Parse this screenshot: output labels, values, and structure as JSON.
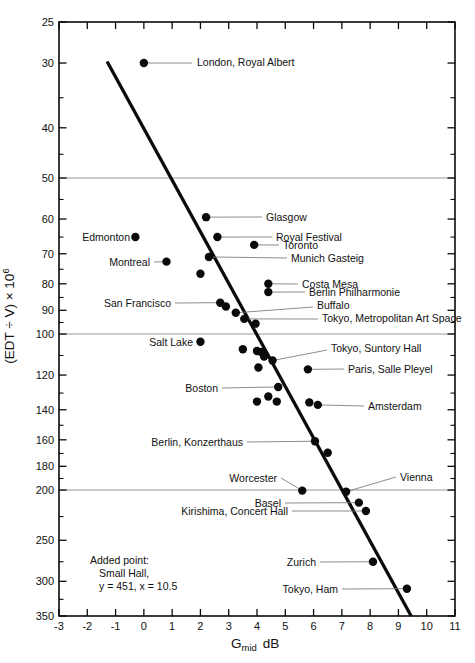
{
  "chart_data": {
    "type": "scatter",
    "title": "",
    "xlabel": {
      "symbol": "G",
      "sub": "mid",
      "unit": "dB"
    },
    "ylabel": {
      "text": "(EDT ÷ V) × 10",
      "sup": "6"
    },
    "xlim": [
      -3,
      11
    ],
    "ylim": [
      25,
      350
    ],
    "yscale": "log",
    "grid": "horizontal-at-50-100-200",
    "x_ticks": [
      -3,
      -2,
      -1,
      0,
      1,
      2,
      3,
      4,
      5,
      6,
      7,
      8,
      9,
      10,
      11
    ],
    "y_ticks_major": [
      25,
      30,
      40,
      50,
      60,
      70,
      80,
      90,
      100,
      120,
      140,
      160,
      180,
      200,
      250,
      300,
      350
    ],
    "y_ticks_minor": [
      35,
      45,
      55,
      65,
      75,
      85,
      95,
      110,
      130,
      150,
      170,
      190,
      225,
      275,
      325
    ],
    "gridlines_y": [
      50,
      100,
      200
    ],
    "regression_line": {
      "x1": -1.3,
      "y1": 29.8,
      "x2": 9.45,
      "y2": 350
    },
    "points": [
      {
        "label": "London, Royal Albert",
        "x": 0.0,
        "y": 30,
        "anchor": "start",
        "label_px": [
          197,
          66
        ],
        "leader": [
          [
            192,
            63
          ]
        ]
      },
      {
        "label": "Glasgow",
        "x": 2.2,
        "y": 59.5,
        "anchor": "start",
        "label_px": [
          266,
          221
        ],
        "leader": [
          [
            262,
            217
          ]
        ]
      },
      {
        "label": "Royal Festival",
        "x": 2.6,
        "y": 65,
        "anchor": "start",
        "label_px": [
          276,
          241
        ],
        "leader": [
          [
            272,
            237
          ]
        ]
      },
      {
        "label": "Toronto",
        "x": 3.9,
        "y": 67.3,
        "anchor": "start",
        "label_px": [
          283,
          249
        ],
        "leader": [
          [
            279,
            245
          ]
        ]
      },
      {
        "label": "Edmonton",
        "x": -0.3,
        "y": 65,
        "anchor": "end",
        "label_px": [
          130,
          241
        ]
      },
      {
        "label": "Montreal",
        "x": 0.8,
        "y": 72.5,
        "anchor": "end",
        "label_px": [
          150,
          266
        ],
        "leader": [
          [
            154,
            262
          ]
        ]
      },
      {
        "label": "Munich Gasteig",
        "x": 2.3,
        "y": 71,
        "anchor": "start",
        "label_px": [
          291,
          262
        ],
        "leader": [
          [
            287,
            258
          ]
        ]
      },
      {
        "label": "",
        "x": 2.0,
        "y": 76.5
      },
      {
        "label": "Costa Mesa",
        "x": 4.4,
        "y": 80,
        "anchor": "start",
        "label_px": [
          302,
          288
        ],
        "leader": [
          [
            298,
            284
          ]
        ]
      },
      {
        "label": "Berlin Philharmonie",
        "x": 4.4,
        "y": 83,
        "anchor": "start",
        "label_px": [
          309,
          296
        ],
        "leader": [
          [
            305,
            292
          ]
        ]
      },
      {
        "label": "San Francisco",
        "x": 2.7,
        "y": 87,
        "anchor": "end",
        "label_px": [
          171,
          307
        ],
        "leader": [
          [
            175,
            303
          ]
        ]
      },
      {
        "label": "",
        "x": 2.9,
        "y": 88.5
      },
      {
        "label": "Buffalo",
        "x": 3.25,
        "y": 91,
        "anchor": "start",
        "label_px": [
          317,
          309
        ],
        "leader": [
          [
            313,
            307
          ]
        ]
      },
      {
        "label": "Tokyo, Metropolitan Art Space",
        "x": 3.55,
        "y": 93.5,
        "anchor": "start",
        "label_px": [
          322,
          322
        ],
        "leader": [
          [
            318,
            319
          ]
        ]
      },
      {
        "label": "",
        "x": 3.95,
        "y": 95.5
      },
      {
        "label": "Salt Lake",
        "x": 2.0,
        "y": 103.5,
        "anchor": "end",
        "label_px": [
          193,
          346
        ]
      },
      {
        "label": "",
        "x": 3.5,
        "y": 107
      },
      {
        "label": "",
        "x": 4.0,
        "y": 107.8
      },
      {
        "label": "",
        "x": 4.15,
        "y": 108.3
      },
      {
        "label": "",
        "x": 4.25,
        "y": 110.5
      },
      {
        "label": "Tokyo, Suntory Hall",
        "x": 4.55,
        "y": 112.5,
        "anchor": "start",
        "label_px": [
          331,
          352
        ],
        "leader": [
          [
            327,
            350
          ]
        ]
      },
      {
        "label": "",
        "x": 4.05,
        "y": 116
      },
      {
        "label": "Paris, Salle Pleyel",
        "x": 5.8,
        "y": 117,
        "anchor": "start",
        "label_px": [
          348,
          373
        ],
        "leader": [
          [
            344,
            369
          ]
        ]
      },
      {
        "label": "Boston",
        "x": 4.75,
        "y": 126.5,
        "anchor": "end",
        "label_px": [
          218,
          392
        ],
        "leader": [
          [
            222,
            388
          ]
        ]
      },
      {
        "label": "",
        "x": 4.4,
        "y": 132
      },
      {
        "label": "",
        "x": 4.0,
        "y": 135
      },
      {
        "label": "",
        "x": 4.7,
        "y": 135
      },
      {
        "label": "",
        "x": 5.85,
        "y": 135.5
      },
      {
        "label": "Amsterdam",
        "x": 6.15,
        "y": 137,
        "anchor": "start",
        "label_px": [
          368,
          410
        ],
        "leader": [
          [
            364,
            406
          ]
        ]
      },
      {
        "label": "Berlin, Konzerthaus",
        "x": 6.05,
        "y": 161,
        "anchor": "end",
        "label_px": [
          243,
          446
        ],
        "leader": [
          [
            247,
            442
          ]
        ]
      },
      {
        "label": "",
        "x": 6.5,
        "y": 169.5
      },
      {
        "label": "Worcester",
        "x": 5.6,
        "y": 200.5,
        "anchor": "end",
        "label_px": [
          277,
          482
        ],
        "leader": [
          [
            281,
            478
          ]
        ]
      },
      {
        "label": "Vienna",
        "x": 7.15,
        "y": 201.5,
        "anchor": "start",
        "label_px": [
          400,
          481
        ],
        "leader": [
          [
            396,
            477
          ]
        ]
      },
      {
        "label": "Basel",
        "x": 7.6,
        "y": 211.5,
        "anchor": "end",
        "label_px": [
          281,
          507
        ],
        "leader": [
          [
            285,
            503
          ]
        ]
      },
      {
        "label": "Kirishima, Concert Hall",
        "x": 7.85,
        "y": 219.5,
        "anchor": "end",
        "label_px": [
          288,
          515
        ],
        "leader": [
          [
            292,
            511
          ]
        ]
      },
      {
        "label": "Zurich",
        "x": 8.1,
        "y": 275,
        "anchor": "end",
        "label_px": [
          316,
          566
        ],
        "leader": [
          [
            320,
            562
          ]
        ]
      },
      {
        "label": "Tokyo, Ham",
        "x": 9.3,
        "y": 310,
        "anchor": "end",
        "label_px": [
          338,
          593
        ],
        "leader": [
          [
            342,
            589
          ]
        ]
      }
    ],
    "annotation": {
      "lines": [
        {
          "text": "Added point:",
          "x": 90,
          "y": 564
        },
        {
          "text": "Small Hall,",
          "x": 99,
          "y": 577
        },
        {
          "text": "y = 451, x = 10.5",
          "x": 99,
          "y": 590
        }
      ]
    },
    "colors": {
      "ink": "#0a0a0a",
      "gridline": "#8a8a8a",
      "leader": "#777777"
    }
  }
}
